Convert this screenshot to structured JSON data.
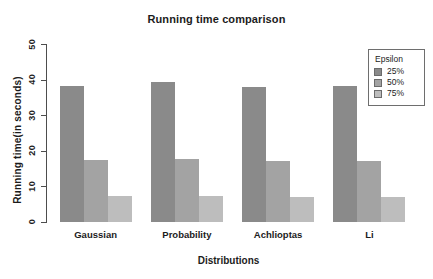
{
  "chart_data": {
    "type": "bar",
    "title": "Running time comparison",
    "xlabel": "Distributions",
    "ylabel": "Running time(in seconds)",
    "categories": [
      "Gaussian",
      "Probability",
      "Achlioptas",
      "Li"
    ],
    "series": [
      {
        "name": "25%",
        "values": [
          38.3,
          39.4,
          38.0,
          38.1
        ],
        "color": "#8a8a8a"
      },
      {
        "name": "50%",
        "values": [
          17.5,
          17.7,
          17.0,
          17.0
        ],
        "color": "#a3a3a3"
      },
      {
        "name": "75%",
        "values": [
          7.3,
          7.2,
          7.0,
          6.9
        ],
        "color": "#bdbdbd"
      }
    ],
    "ylim": [
      0,
      50
    ],
    "yticks": [
      0,
      10,
      20,
      30,
      40,
      50
    ],
    "ytick_labels": [
      "0",
      "10",
      "20",
      "30",
      "40",
      "50"
    ],
    "grid": false,
    "legend": {
      "title": "Epsilon",
      "position": "top-right",
      "entries": [
        "25%",
        "50%",
        "75%"
      ]
    },
    "axis_color": "#4d4d4d",
    "background": "#ffffff"
  }
}
